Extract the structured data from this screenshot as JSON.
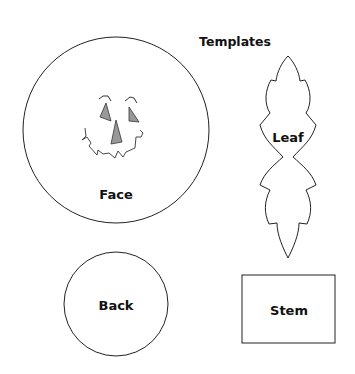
{
  "title": "Templates",
  "pieces": {
    "face": {
      "label": "Face"
    },
    "leaf": {
      "label": "Leaf"
    },
    "back": {
      "label": "Back"
    },
    "stem": {
      "label": "Stem"
    }
  },
  "colors": {
    "outline": "#222222",
    "fill_features": "#999999"
  }
}
